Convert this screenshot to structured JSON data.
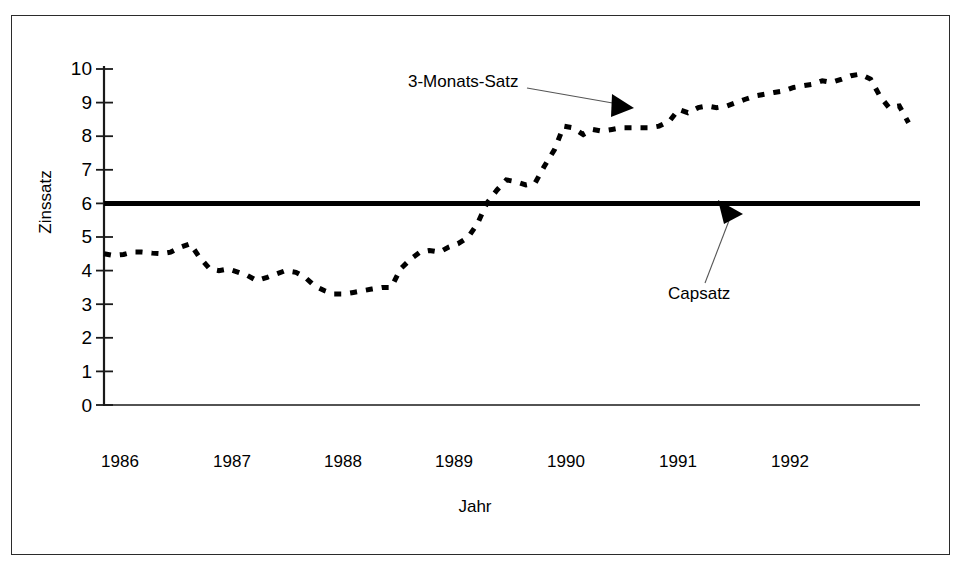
{
  "chart_data": {
    "type": "line",
    "title": "",
    "xlabel": "Jahr",
    "ylabel": "Zinssatz",
    "xlim": [
      1986.0,
      1993.1
    ],
    "ylim": [
      0,
      10
    ],
    "yticks": [
      0,
      1,
      2,
      3,
      4,
      5,
      6,
      7,
      8,
      9,
      10
    ],
    "xticks": [
      1986,
      1987,
      1988,
      1989,
      1990,
      1991,
      1992
    ],
    "xtick_labels": [
      "1986",
      "1987",
      "1988",
      "1989",
      "1990",
      "1991",
      "1992"
    ],
    "ytick_labels": [
      "0",
      "1",
      "2",
      "3",
      "4",
      "5",
      "6",
      "7",
      "8",
      "9",
      "10"
    ],
    "grid": false,
    "legend": "none",
    "annotations": [
      {
        "text": "3-Monats-Satz",
        "points_to": "dotted-series",
        "arrow": true
      },
      {
        "text": "Capsatz",
        "points_to": "cap-line",
        "arrow": true
      }
    ],
    "series": [
      {
        "name": "3-Monats-Satz",
        "style": "dotted",
        "color": "#000000",
        "x": [
          1986.0,
          1986.08,
          1986.17,
          1986.25,
          1986.33,
          1986.42,
          1986.5,
          1986.58,
          1986.67,
          1986.75,
          1986.83,
          1986.92,
          1987.0,
          1987.08,
          1987.17,
          1987.25,
          1987.33,
          1987.42,
          1987.5,
          1987.58,
          1987.67,
          1987.75,
          1987.83,
          1987.92,
          1988.0,
          1988.08,
          1988.17,
          1988.25,
          1988.33,
          1988.42,
          1988.5,
          1988.58,
          1988.67,
          1988.75,
          1988.83,
          1988.92,
          1989.0,
          1989.08,
          1989.17,
          1989.25,
          1989.33,
          1989.42,
          1989.5,
          1989.58,
          1989.67,
          1989.75,
          1989.83,
          1989.92,
          1990.0,
          1990.08,
          1990.17,
          1990.25,
          1990.33,
          1990.42,
          1990.5,
          1990.58,
          1990.67,
          1990.75,
          1990.83,
          1990.92,
          1991.0,
          1991.08,
          1991.17,
          1991.25,
          1991.33,
          1991.42,
          1991.5,
          1991.58,
          1991.67,
          1991.75,
          1991.83,
          1991.92,
          1992.0,
          1992.08,
          1992.17,
          1992.25,
          1992.33,
          1992.42,
          1992.5,
          1992.58,
          1992.67,
          1992.75,
          1992.83,
          1992.92,
          1993.0
        ],
        "y": [
          4.5,
          4.45,
          4.48,
          4.55,
          4.55,
          4.52,
          4.5,
          4.55,
          4.7,
          4.8,
          4.4,
          4.05,
          4.0,
          4.05,
          3.95,
          3.85,
          3.7,
          3.8,
          3.9,
          4.0,
          3.95,
          3.8,
          3.55,
          3.4,
          3.3,
          3.3,
          3.35,
          3.4,
          3.45,
          3.5,
          3.5,
          4.05,
          4.35,
          4.55,
          4.6,
          4.55,
          4.7,
          4.8,
          5.0,
          5.4,
          6.0,
          6.4,
          6.7,
          6.65,
          6.55,
          6.6,
          7.1,
          7.6,
          8.3,
          8.25,
          8.05,
          8.2,
          8.15,
          8.2,
          8.25,
          8.25,
          8.25,
          8.25,
          8.3,
          8.45,
          8.8,
          8.7,
          8.85,
          8.9,
          8.85,
          8.9,
          9.0,
          9.1,
          9.2,
          9.25,
          9.3,
          9.35,
          9.45,
          9.5,
          9.55,
          9.65,
          9.6,
          9.7,
          9.8,
          9.85,
          9.7,
          9.2,
          8.85,
          8.9,
          8.4
        ]
      },
      {
        "name": "Capsatz",
        "style": "solid-thick",
        "color": "#000000",
        "constant_value": 6.0
      }
    ]
  },
  "labels": {
    "ylabel": "Zinssatz",
    "xlabel": "Jahr",
    "annot_series": "3-Monats-Satz",
    "annot_cap": "Capsatz"
  }
}
